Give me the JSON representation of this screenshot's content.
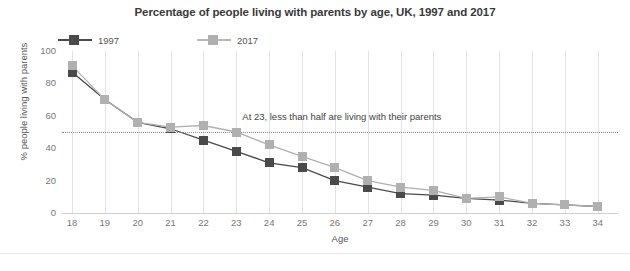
{
  "chart_data": {
    "type": "line",
    "title": "Percentage of people living with parents by age, UK, 1997 and 2017",
    "xlabel": "Age",
    "ylabel": "% people living with parents",
    "categories": [
      18,
      19,
      20,
      21,
      22,
      23,
      24,
      25,
      26,
      27,
      28,
      29,
      30,
      31,
      32,
      33,
      34
    ],
    "x": [
      18,
      19,
      20,
      21,
      22,
      23,
      24,
      25,
      26,
      27,
      28,
      29,
      30,
      31,
      32,
      33,
      34
    ],
    "series": [
      {
        "name": "1997",
        "color": "#4a4a4a",
        "values": [
          87,
          70,
          56,
          52,
          45,
          38,
          31,
          28,
          20,
          16,
          12,
          11,
          9,
          8,
          6,
          5,
          4
        ]
      },
      {
        "name": "2017",
        "color": "#b0b0b0",
        "values": [
          91,
          70,
          56,
          53,
          54,
          50,
          42,
          35,
          28,
          20,
          16,
          14,
          9,
          10,
          6,
          5,
          4
        ]
      }
    ],
    "ylim": [
      0,
      100
    ],
    "yticks": [
      0,
      20,
      40,
      60,
      80,
      100
    ],
    "ytick_labels": [
      "0",
      "20",
      "40",
      "60",
      "80",
      "100"
    ],
    "xtick_labels": [
      "18",
      "19",
      "20",
      "21",
      "22",
      "23",
      "24",
      "25",
      "26",
      "27",
      "28",
      "29",
      "30",
      "31",
      "32",
      "33",
      "34"
    ],
    "grid": "vertical",
    "legend_position": "top-left",
    "reference_line": {
      "value": 50,
      "style": "dotted",
      "label": "At 23, less than half are living with their parents"
    },
    "annotations": [
      {
        "text": "At 23, less than half are living with their parents",
        "x": 23,
        "y": 55
      }
    ]
  },
  "legend": {
    "items": [
      {
        "label": "1997",
        "color": "#4a4a4a"
      },
      {
        "label": "2017",
        "color": "#b0b0b0"
      }
    ]
  }
}
